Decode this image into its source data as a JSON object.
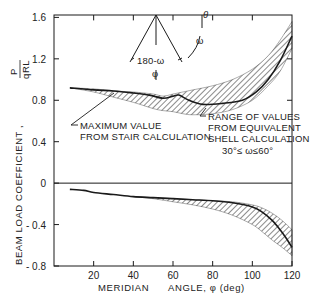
{
  "chart_data": {
    "type": "area",
    "title": "",
    "xlabel": "MERIDIAN ANGLE, φ (deg)",
    "xlabel_parts": {
      "left": "MERIDIAN",
      "right": "ANGLE, φ (deg)"
    },
    "ylabel": "BEAM LOAD COEFFICIENT, P/qRL",
    "ylabel_parts": {
      "text": "BEAM  LOAD  COEFFICIENT ,",
      "frac_num": "P",
      "frac_den": "qRL"
    },
    "xlim": [
      0,
      120
    ],
    "ylim": [
      -0.8,
      1.6
    ],
    "x_ticks": [
      20,
      40,
      60,
      80,
      100,
      120
    ],
    "x_tick_labels": [
      "20",
      "40",
      "60",
      "80",
      "100",
      "120"
    ],
    "y_ticks": [
      1.6,
      1.2,
      0.8,
      0.4,
      0,
      -0.4,
      -0.8
    ],
    "y_tick_labels": [
      "1.6",
      "1.2",
      "0.8",
      "0.4",
      "0",
      "- 0.4",
      "- 0.8"
    ],
    "grid": false,
    "zero_line": true,
    "series": [
      {
        "name": "Maximum value from stair calculation (positive)",
        "style": "solid-line",
        "x": [
          8,
          20,
          30,
          40,
          48,
          55,
          60,
          63,
          68,
          75,
          85,
          95,
          102,
          108,
          114,
          120
        ],
        "values": [
          0.92,
          0.9,
          0.89,
          0.87,
          0.85,
          0.82,
          0.84,
          0.85,
          0.8,
          0.76,
          0.77,
          0.8,
          0.88,
          1.0,
          1.18,
          1.42
        ]
      },
      {
        "name": "Range of values from equivalent shell calculation, 30° ≤ ω ≤ 60° (positive)",
        "style": "hatched-band",
        "x": [
          8,
          20,
          30,
          40,
          50,
          55,
          60,
          65,
          70,
          80,
          90,
          100,
          108,
          114,
          120
        ],
        "upper": [
          0.92,
          0.91,
          0.89,
          0.88,
          0.86,
          0.84,
          0.86,
          0.88,
          0.9,
          0.94,
          1.0,
          1.1,
          1.23,
          1.38,
          1.56
        ],
        "lower": [
          0.92,
          0.88,
          0.83,
          0.78,
          0.72,
          0.7,
          0.69,
          0.67,
          0.66,
          0.67,
          0.71,
          0.8,
          0.94,
          1.08,
          1.3
        ]
      },
      {
        "name": "Maximum value from stair calculation (negative)",
        "style": "solid-line",
        "x": [
          8,
          15,
          20,
          30,
          40,
          50,
          60,
          70,
          80,
          90,
          100,
          105,
          110,
          114,
          117,
          120
        ],
        "values": [
          -0.06,
          -0.07,
          -0.09,
          -0.11,
          -0.13,
          -0.14,
          -0.15,
          -0.16,
          -0.17,
          -0.19,
          -0.23,
          -0.28,
          -0.36,
          -0.45,
          -0.53,
          -0.62
        ]
      },
      {
        "name": "Range of values from equivalent shell calculation (negative)",
        "style": "hatched-band",
        "x": [
          40,
          50,
          60,
          70,
          80,
          90,
          100,
          105,
          110,
          115,
          120
        ],
        "upper": [
          -0.13,
          -0.14,
          -0.15,
          -0.16,
          -0.17,
          -0.18,
          -0.21,
          -0.24,
          -0.29,
          -0.36,
          -0.45
        ],
        "lower": [
          -0.13,
          -0.15,
          -0.18,
          -0.21,
          -0.25,
          -0.31,
          -0.4,
          -0.47,
          -0.55,
          -0.62,
          -0.7
        ]
      }
    ],
    "annotations": [
      {
        "text": [
          "MAXIMUM VALUE",
          "FROM STAIR CALCULATION"
        ],
        "points_to": "stair curve near φ≈45°"
      },
      {
        "text": [
          "RANGE OF VALUES",
          "FROM EQUIVALENT",
          "SHELL CALCULATION",
          "30°≤ ω≤60°"
        ],
        "points_to": "hatched band near φ≈70°"
      }
    ],
    "inset_diagram": {
      "labels": {
        "theta": "θ",
        "omega": "ω",
        "angle": "180-ω",
        "phi": "φ"
      }
    }
  },
  "annotations": {
    "stair_l1": "MAXIMUM VALUE",
    "stair_l2": "FROM STAIR CALCULATION",
    "shell_l1": "RANGE OF VALUES",
    "shell_l2": "FROM EQUIVALENT",
    "shell_l3": "SHELL CALCULATION",
    "shell_l4": "30°≤ ω≤60°"
  },
  "inset": {
    "theta": "θ",
    "omega": "ω",
    "angle": "180-ω",
    "phi": "φ"
  },
  "colors": {
    "ink": "#1a1a1a",
    "background": "#ffffff"
  }
}
